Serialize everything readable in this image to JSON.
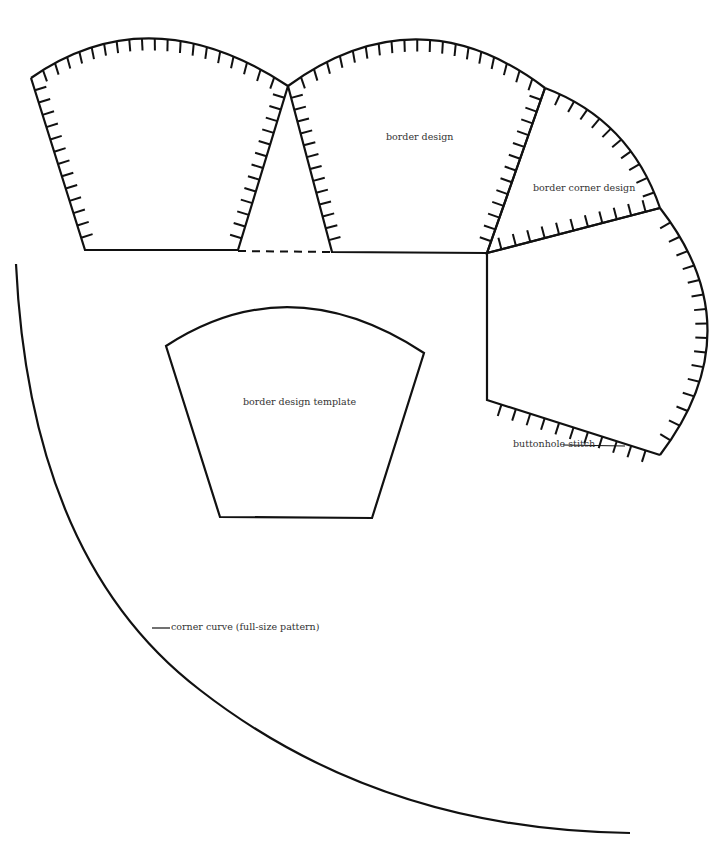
{
  "labels": {
    "border_design": "border design",
    "border_corner_design": "border corner design",
    "border_design_template": "border design template",
    "buttonhole_stitch": "buttonhole stitch",
    "corner_curve": "corner curve (full-size pattern)"
  },
  "colors": {
    "line": "#111111",
    "text": "#333333",
    "background": "#ffffff"
  }
}
